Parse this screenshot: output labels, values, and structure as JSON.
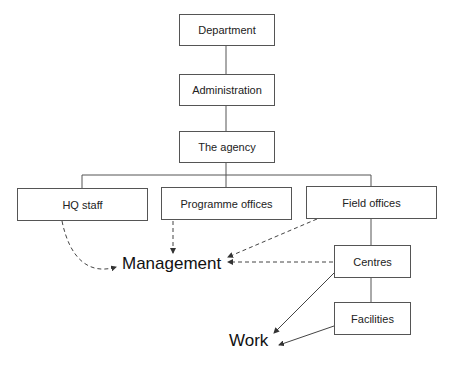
{
  "diagram": {
    "type": "organisational-hierarchy",
    "nodes": {
      "department": "Department",
      "administration": "Administration",
      "agency": "The agency",
      "hq_staff": "HQ staff",
      "programme_offices": "Programme offices",
      "field_offices": "Field offices",
      "centres": "Centres",
      "facilities": "Facilities"
    },
    "outcomes": {
      "management": "Management",
      "work": "Work"
    },
    "edges": [
      {
        "from": "Department",
        "to": "Administration",
        "style": "solid"
      },
      {
        "from": "Administration",
        "to": "The agency",
        "style": "solid"
      },
      {
        "from": "The agency",
        "to": "HQ staff",
        "style": "solid"
      },
      {
        "from": "The agency",
        "to": "Programme offices",
        "style": "solid"
      },
      {
        "from": "The agency",
        "to": "Field offices",
        "style": "solid"
      },
      {
        "from": "Field offices",
        "to": "Centres",
        "style": "solid"
      },
      {
        "from": "Centres",
        "to": "Facilities",
        "style": "solid"
      },
      {
        "from": "HQ staff",
        "to": "Management",
        "style": "dashed-arrow"
      },
      {
        "from": "Programme offices",
        "to": "Management",
        "style": "dashed-arrow"
      },
      {
        "from": "Field offices",
        "to": "Management",
        "style": "dashed-arrow"
      },
      {
        "from": "Centres",
        "to": "Management",
        "style": "dashed-arrow"
      },
      {
        "from": "Centres",
        "to": "Work",
        "style": "solid-arrow"
      },
      {
        "from": "Facilities",
        "to": "Work",
        "style": "solid-arrow"
      }
    ]
  }
}
